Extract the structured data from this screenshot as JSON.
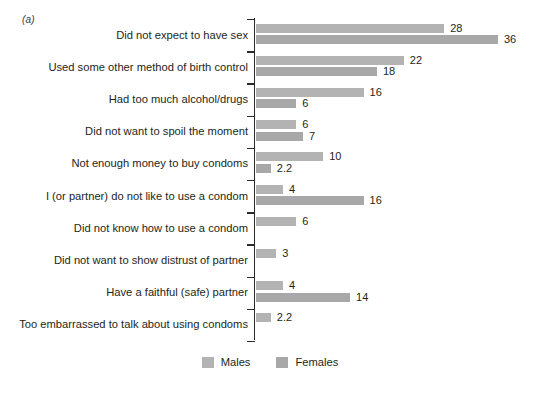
{
  "panel": {
    "label": "(a)"
  },
  "legend": {
    "position": "bottom-center",
    "entries": [
      {
        "name": "Males",
        "label": "Males",
        "color": "#b3b3b3"
      },
      {
        "name": "Females",
        "label": "Females",
        "color": "#a8a8a8"
      }
    ]
  },
  "chart_data": {
    "type": "bar",
    "orientation": "horizontal",
    "title": "",
    "xlabel": "",
    "ylabel": "",
    "grid": false,
    "xlim": [
      0,
      38
    ],
    "legend_position": "bottom-center",
    "categories": [
      "Did not expect to have sex",
      "Used some other method of birth control",
      "Had too much alcohol/drugs",
      "Did not want to spoil the moment",
      "Not enough money to buy condoms",
      "I (or partner) do not like to use a condom",
      "Did not know how to use a condom",
      "Did not want to show distrust of partner",
      "Have a faithful (safe) partner",
      "Too embarrassed to talk about using condoms"
    ],
    "series": [
      {
        "name": "Males",
        "color": "#b3b3b3",
        "values": [
          28,
          22,
          16,
          6,
          10,
          4,
          6,
          3,
          4,
          2.2
        ],
        "labels": [
          "28",
          "22",
          "16",
          "6",
          "10",
          "4",
          "6",
          "3",
          "4",
          "2.2"
        ]
      },
      {
        "name": "Females",
        "color": "#a8a8a8",
        "values": [
          36,
          18,
          6,
          7,
          2.2,
          16,
          null,
          null,
          14,
          null
        ],
        "labels": [
          "36",
          "18",
          "6",
          "7",
          "2.2",
          "16",
          "",
          "",
          "14",
          ""
        ]
      }
    ]
  }
}
